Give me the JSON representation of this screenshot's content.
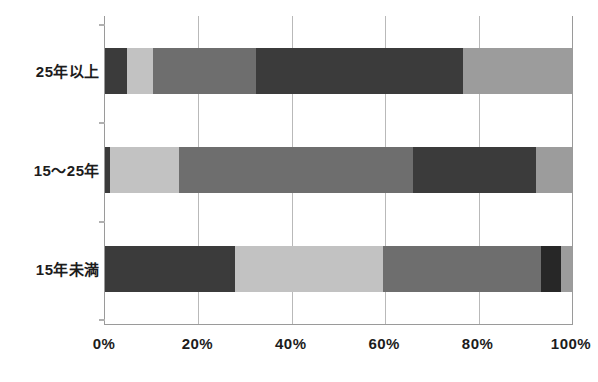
{
  "chart_data": {
    "type": "bar",
    "orientation": "horizontal",
    "stacked": true,
    "normalized_percent": true,
    "title": "",
    "subtitle": "",
    "xlabel": "",
    "ylabel": "",
    "xlim": [
      0,
      100
    ],
    "xticks": [
      0,
      20,
      40,
      60,
      80,
      100
    ],
    "xtick_labels": [
      "0%",
      "20%",
      "40%",
      "60%",
      "80%",
      "100%"
    ],
    "grid": true,
    "grid_axis": "x",
    "legend": false,
    "legend_position": "none",
    "categories": [
      "25年以上",
      "15〜25年",
      "15年未満"
    ],
    "series": [
      {
        "name": "series-1",
        "color": "#3b3b3b",
        "values": [
          4.7,
          1.0,
          27.8
        ]
      },
      {
        "name": "series-2",
        "color": "#c2c2c2",
        "values": [
          5.6,
          14.8,
          31.7
        ]
      },
      {
        "name": "series-3",
        "color": "#6e6e6e",
        "values": [
          22.0,
          50.2,
          33.9
        ]
      },
      {
        "name": "series-4",
        "color": "#3b3b3b",
        "values": [
          44.4,
          26.3,
          4.2
        ]
      },
      {
        "name": "series-5",
        "color": "#9c9c9c",
        "values": [
          23.3,
          7.7,
          2.4
        ]
      }
    ],
    "bars": [
      {
        "category": "25年以上",
        "segments": [
          {
            "value": 4.7,
            "color": "#3b3b3b"
          },
          {
            "value": 5.6,
            "color": "#c2c2c2"
          },
          {
            "value": 22.0,
            "color": "#6e6e6e"
          },
          {
            "value": 44.4,
            "color": "#3b3b3b"
          },
          {
            "value": 23.3,
            "color": "#9c9c9c"
          }
        ]
      },
      {
        "category": "15〜25年",
        "segments": [
          {
            "value": 1.0,
            "color": "#3b3b3b"
          },
          {
            "value": 14.8,
            "color": "#c2c2c2"
          },
          {
            "value": 50.2,
            "color": "#6e6e6e"
          },
          {
            "value": 26.3,
            "color": "#3b3b3b"
          },
          {
            "value": 7.7,
            "color": "#9c9c9c"
          }
        ]
      },
      {
        "category": "15年未満",
        "segments": [
          {
            "value": 27.8,
            "color": "#3b3b3b"
          },
          {
            "value": 31.7,
            "color": "#c2c2c2"
          },
          {
            "value": 33.9,
            "color": "#6e6e6e"
          },
          {
            "value": 4.2,
            "color": "#272727"
          },
          {
            "value": 2.4,
            "color": "#9c9c9c"
          }
        ]
      }
    ]
  },
  "axis": {
    "x_tick_labels": [
      "0%",
      "20%",
      "40%",
      "60%",
      "80%",
      "100%"
    ],
    "y_category_labels": [
      "25年以上",
      "15〜25年",
      "15年未満"
    ]
  },
  "style": {
    "background": "#ffffff",
    "frame_color": "#9a9a9a",
    "gridline_color": "#b9b9b9",
    "text_color": "#1c1c1c"
  }
}
